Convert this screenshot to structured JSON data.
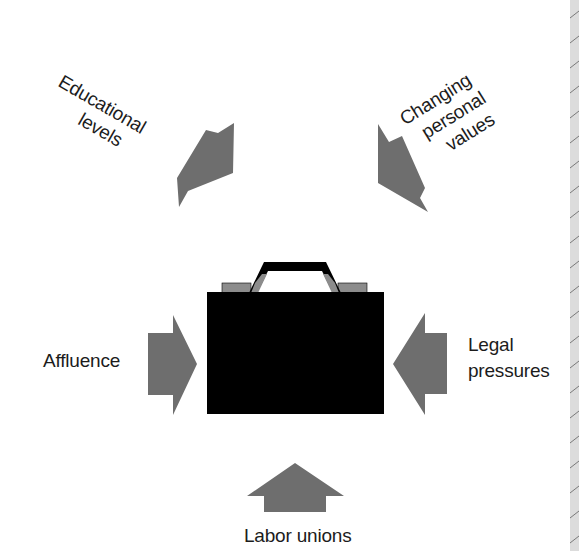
{
  "diagram": {
    "center": {
      "name": "briefcase",
      "icon": "briefcase-icon",
      "colors": {
        "body": "#000000",
        "handle": "#000000",
        "latch": "#8c8c8c",
        "handle_side": "#8c8c8c"
      }
    },
    "forces": [
      {
        "id": "educational",
        "lines": [
          "Educational",
          "levels"
        ],
        "direction": "down-right",
        "position": "top-left"
      },
      {
        "id": "personal-values",
        "lines": [
          "Changing",
          "personal",
          "values"
        ],
        "direction": "down-left",
        "position": "top-right"
      },
      {
        "id": "affluence",
        "lines": [
          "Affluence"
        ],
        "direction": "right",
        "position": "left"
      },
      {
        "id": "legal",
        "lines": [
          "Legal",
          "pressures"
        ],
        "direction": "left",
        "position": "right"
      },
      {
        "id": "labor",
        "lines": [
          "Labor unions"
        ],
        "direction": "up",
        "position": "bottom"
      }
    ],
    "colors": {
      "arrow": "#6e6e6e",
      "background": "#ffffff",
      "text": "#1c1c1c",
      "edge_strip": "#dcdcdc",
      "edge_hatch": "#7a7a7a"
    }
  }
}
